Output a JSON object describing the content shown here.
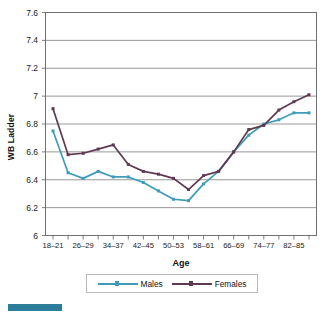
{
  "chart_data": {
    "type": "line",
    "title": "",
    "xlabel": "Age",
    "ylabel": "WB Ladder",
    "ylim": [
      6,
      7.6
    ],
    "yticks": [
      "6",
      "6.2",
      "6.4",
      "6.6",
      "6.8",
      "7",
      "7.2",
      "7.4",
      "7.6"
    ],
    "ytick_values": [
      6,
      6.2,
      6.4,
      6.6,
      6.8,
      7,
      7.2,
      7.4,
      7.6
    ],
    "grid": "horizontal",
    "legend_position": "bottom",
    "categories": [
      "18-21",
      "22-25",
      "26-29",
      "30-33",
      "34-37",
      "38-41",
      "42-45",
      "46-49",
      "50-53",
      "54-57",
      "58-61",
      "62-65",
      "66-69",
      "70-73",
      "74-77",
      "78-81",
      "82-85",
      "86-89"
    ],
    "xtick_labels_shown": [
      "18–21",
      "26–29",
      "34–37",
      "42–45",
      "50–53",
      "58–61",
      "66–69",
      "74–77",
      "82–85"
    ],
    "series": [
      {
        "name": "Males",
        "color": "#3f9cb8",
        "values": [
          6.75,
          6.45,
          6.41,
          6.46,
          6.42,
          6.42,
          6.38,
          6.32,
          6.26,
          6.25,
          6.37,
          6.46,
          6.6,
          6.72,
          6.8,
          6.83,
          6.88,
          6.88
        ]
      },
      {
        "name": "Females",
        "color": "#5e3a52",
        "values": [
          6.91,
          6.58,
          6.59,
          6.62,
          6.65,
          6.51,
          6.46,
          6.44,
          6.41,
          6.33,
          6.43,
          6.46,
          6.6,
          6.76,
          6.79,
          6.9,
          6.96,
          7.01
        ]
      }
    ]
  },
  "legend": {
    "items": [
      {
        "label": "Males",
        "color": "#3f9cb8"
      },
      {
        "label": "Females",
        "color": "#5e3a52"
      }
    ]
  },
  "decoration": {
    "corner_bar_color": "#2d7f99"
  },
  "axis_style": {
    "frame_color": "#6f6f6f",
    "grid_color": "#8c8c8c"
  }
}
